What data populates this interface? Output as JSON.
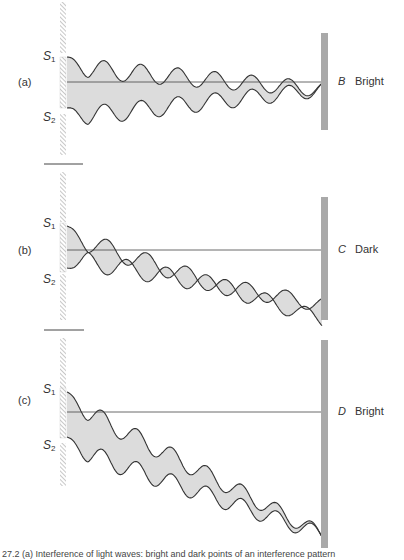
{
  "figure": {
    "panels": [
      {
        "id": "a",
        "label": "(a)",
        "slit1": "S",
        "slit1_sub": "1",
        "slit2": "S",
        "slit2_sub": "2",
        "point": "B",
        "result": "Bright",
        "geometry": {
          "wall_top": 2,
          "wall_bottom": 155,
          "slit_block_top": 57,
          "slit_block_bottom": 108,
          "center_y": 82,
          "screen_top": 33,
          "screen_bottom": 130,
          "end_y": 82,
          "s1_y": 57,
          "s2_y": 108,
          "amp": 10,
          "periods": 6.9,
          "phase1": 0.25,
          "phase2": 0.25
        }
      },
      {
        "id": "b",
        "label": "(b)",
        "slit1": "S",
        "slit1_sub": "1",
        "slit2": "S",
        "slit2_sub": "2",
        "point": "C",
        "result": "Dark",
        "geometry": {
          "wall_top": 172,
          "wall_bottom": 320,
          "slit_block_top": 223,
          "slit_block_bottom": 272,
          "center_y": 250,
          "screen_top": 197,
          "screen_bottom": 320,
          "end_y": 312,
          "s1_y": 226,
          "s2_y": 268,
          "amp": 10,
          "periods": 6.4,
          "phase1": 0.25,
          "phase2": 0.25
        }
      },
      {
        "id": "c",
        "label": "(c)",
        "slit1": "S",
        "slit1_sub": "1",
        "slit2": "S",
        "slit2_sub": "2",
        "point": "D",
        "result": "Bright",
        "geometry": {
          "wall_top": 338,
          "wall_bottom": 486,
          "slit_block_top": 388,
          "slit_block_bottom": 438,
          "center_y": 412,
          "screen_top": 340,
          "screen_bottom": 548,
          "end_y": 527,
          "s1_y": 392,
          "s2_y": 437,
          "amp": 10,
          "periods": 7.3,
          "phase1": 0.25,
          "phase2": 0.25
        }
      }
    ],
    "dividers": [
      {
        "y": 164,
        "x1": 44,
        "x2": 83
      },
      {
        "y": 330,
        "x1": 44,
        "x2": 84
      }
    ],
    "caption": "27.2 (a) Interference of light waves: bright and dark points of an interference pattern"
  },
  "colors": {
    "wave_fill": "#dcdcdc",
    "wave_stroke": "#333333",
    "screen": "#a9a9a9",
    "hatch": "#9a9a9a",
    "line": "#444444"
  }
}
